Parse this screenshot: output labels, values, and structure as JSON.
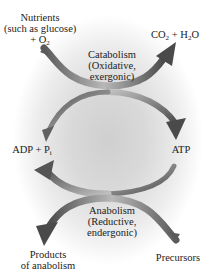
{
  "diagram": {
    "type": "metabolic-cycle",
    "colors": {
      "arrow_dark": "#4a4a4a",
      "arrow_light": "#b5b5b5",
      "background_center": "#cfcfcf",
      "background_edge": "#ffffff",
      "text": "#222222"
    },
    "labels": {
      "nutrients_line1": "Nutrients",
      "nutrients_line2": "(such as glucose)",
      "nutrients_line3_prefix": "+ O",
      "nutrients_line3_sub": "2",
      "co2_prefix": "CO",
      "co2_sub": "2",
      "co2_mid": " + H",
      "h2o_sub": "2",
      "h2o_suffix": "O",
      "catabolism_line1": "Catabolism",
      "catabolism_line2": "(Oxidative,",
      "catabolism_line3": "exergonic)",
      "adp_prefix": "ADP + P",
      "adp_sub": "i",
      "atp": "ATP",
      "anabolism_line1": "Anabolism",
      "anabolism_line2": "(Reductive,",
      "anabolism_line3": "endergonic)",
      "products_line1": "Products",
      "products_line2": "of anabolism",
      "precursors": "Precursors"
    },
    "arrows": [
      {
        "from": "Nutrients + O2",
        "to": "CO2 + H2O",
        "process": "Catabolism"
      },
      {
        "from": "ADP + Pi",
        "to": "ATP",
        "process": "Catabolism (energy capture)"
      },
      {
        "from": "ATP",
        "to": "ADP + Pi",
        "process": "Anabolism (energy use)"
      },
      {
        "from": "Precursors",
        "to": "Products of anabolism",
        "process": "Anabolism"
      }
    ]
  }
}
